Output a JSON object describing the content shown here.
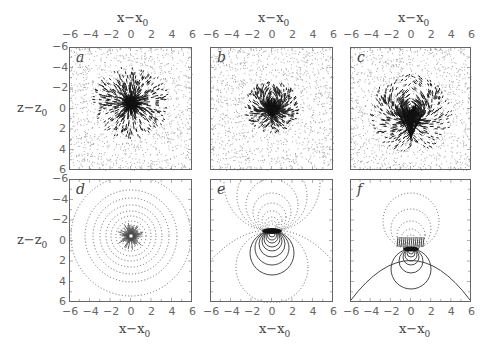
{
  "figure": {
    "layout": "2x3 grid of square panels",
    "x_axis_label": "x−x",
    "x_axis_sub": "0",
    "y_axis_label": "z−z",
    "y_axis_sub": "0",
    "tick_labels": [
      "−6",
      "−4",
      "−2",
      "0",
      "2",
      "4",
      "6"
    ],
    "y_tick_labels": [
      "−6",
      "−4",
      "−2",
      "0",
      "2",
      "4",
      "6"
    ],
    "panels": [
      {
        "label": "a",
        "row": 1,
        "col": 1,
        "kind": "vector field (noisy, radial convergence at center)"
      },
      {
        "label": "b",
        "row": 1,
        "col": 2,
        "kind": "vector field (noisy, small dipole-like vortex pair)"
      },
      {
        "label": "c",
        "row": 1,
        "col": 3,
        "kind": "vector field (noisy, strong vortex pair below center)"
      },
      {
        "label": "d",
        "row": 2,
        "col": 1,
        "kind": "contour plot (concentric dotted circles, radial arrows at center)"
      },
      {
        "label": "e",
        "row": 2,
        "col": 2,
        "kind": "contour plot (dipole: dotted above, solid below)"
      },
      {
        "label": "f",
        "row": 2,
        "col": 3,
        "kind": "contour plot (dipole with solid arc boundary)"
      }
    ]
  },
  "chart_data": [
    {
      "type": "other",
      "panel": "a",
      "title": "",
      "xlabel": "x−x0",
      "ylabel": "z−z0",
      "xlim": [
        -6,
        6
      ],
      "ylim": [
        6,
        -6
      ],
      "xticks": [
        -6,
        -4,
        -2,
        0,
        2,
        4,
        6
      ],
      "yticks": [
        -6,
        -4,
        -2,
        0,
        2,
        4,
        6
      ],
      "description": "Noisy vector field converging toward origin"
    },
    {
      "type": "other",
      "panel": "b",
      "title": "",
      "xlabel": "x−x0",
      "ylabel": "",
      "xlim": [
        -6,
        6
      ],
      "ylim": [
        6,
        -6
      ],
      "xticks": [
        -6,
        -4,
        -2,
        0,
        2,
        4,
        6
      ],
      "description": "Noisy vector field with small vortex pair near origin"
    },
    {
      "type": "other",
      "panel": "c",
      "title": "",
      "xlabel": "x−x0",
      "ylabel": "",
      "xlim": [
        -6,
        6
      ],
      "ylim": [
        6,
        -6
      ],
      "xticks": [
        -6,
        -4,
        -2,
        0,
        2,
        4,
        6
      ],
      "description": "Noisy vector field with strong vortex pair around z−z0≈1"
    },
    {
      "type": "other",
      "panel": "d",
      "title": "",
      "xlabel": "x−x0",
      "ylabel": "z−z0",
      "xlim": [
        -6,
        6
      ],
      "ylim": [
        6,
        -6
      ],
      "xticks": [
        -6,
        -4,
        -2,
        0,
        2,
        4,
        6
      ],
      "yticks": [
        -6,
        -4,
        -2,
        0,
        2,
        4,
        6
      ],
      "description": "Concentric dotted circular contours centered near (0,-0.5)"
    },
    {
      "type": "other",
      "panel": "e",
      "title": "",
      "xlabel": "x−x0",
      "ylabel": "",
      "xlim": [
        -6,
        6
      ],
      "ylim": [
        6,
        -6
      ],
      "xticks": [
        -6,
        -4,
        -2,
        0,
        2,
        4,
        6
      ],
      "description": "Dipole contours: dotted lobes above origin, solid lobes below"
    },
    {
      "type": "other",
      "panel": "f",
      "title": "",
      "xlabel": "x−x0",
      "ylabel": "",
      "xlim": [
        -6,
        6
      ],
      "ylim": [
        6,
        -6
      ],
      "xticks": [
        -6,
        -4,
        -2,
        0,
        2,
        4,
        6
      ],
      "description": "Dipole contours with solid semicircular boundary from (-6,6) to (6,6)"
    }
  ]
}
